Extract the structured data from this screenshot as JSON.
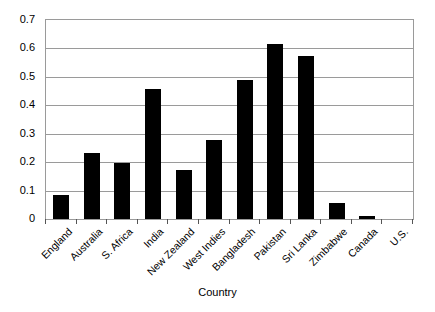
{
  "chart_data": {
    "type": "bar",
    "title": "",
    "subtitle": "",
    "xlabel": "Country",
    "ylabel": "",
    "ylim": [
      0,
      0.7
    ],
    "ytick_step": 0.1,
    "yticks": [
      "0.7",
      "0.6",
      "0.5",
      "0.4",
      "0.3",
      "0.2",
      "0.1",
      "0"
    ],
    "ytick_values": [
      0.7,
      0.6,
      0.5,
      0.4,
      0.3,
      0.2,
      0.1,
      0
    ],
    "grid": "horizontal",
    "legend": "none",
    "bar_color": "#000000",
    "gridline_color": "#9a9a9a",
    "categories": [
      "England",
      "Australia",
      "S. Africa",
      "India",
      "New Zealand",
      "West Indies",
      "Bangladesh",
      "Pakistan",
      "Sri Lanka",
      "Zimbabwe",
      "Canada",
      "U.S."
    ],
    "values": [
      0.085,
      0.232,
      0.197,
      0.458,
      0.172,
      0.278,
      0.49,
      0.615,
      0.575,
      0.055,
      0.01,
      0.0
    ]
  }
}
